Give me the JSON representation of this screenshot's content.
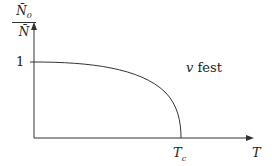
{
  "diagram": {
    "y_axis_label": {
      "numerator": "N̄",
      "numerator_sub": "0",
      "denominator": "N̄"
    },
    "x_axis_label": "T",
    "y_tick": "1",
    "x_tick": {
      "base": "T",
      "sub": "c"
    },
    "annotation": {
      "var": "v",
      "text": " fest"
    },
    "colors": {
      "line": "#333333",
      "background": "#ffffff"
    }
  }
}
